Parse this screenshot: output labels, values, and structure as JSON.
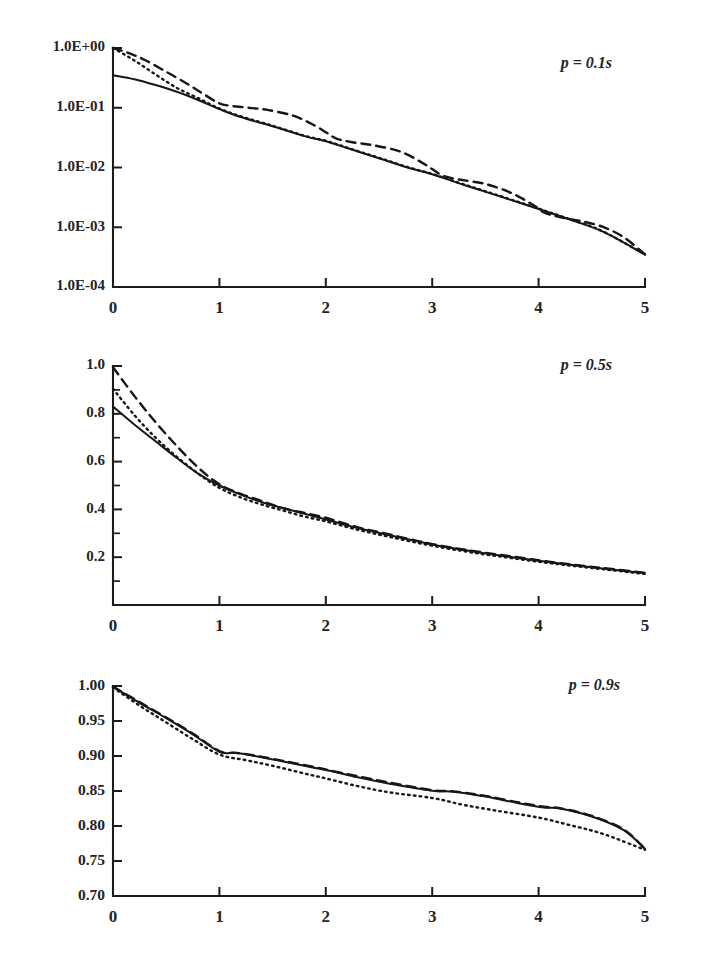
{
  "figure": {
    "background": "#ffffff",
    "ink_color": "#1a1a1a",
    "panel_count": 3
  },
  "chart_data": [
    {
      "type": "line",
      "title": "",
      "annotation": "p = 0.1s",
      "xlabel": "",
      "ylabel": "",
      "yscale": "log",
      "xlim": [
        0,
        5
      ],
      "ylim": [
        0.0001,
        1.0
      ],
      "xticks": [
        0,
        1,
        2,
        3,
        4,
        5
      ],
      "xtick_labels": [
        "0",
        "1",
        "2",
        "3",
        "4",
        "5"
      ],
      "yticks": [
        1.0,
        0.1,
        0.01,
        0.001,
        0.0001
      ],
      "ytick_labels": [
        "1.0E+00",
        "1.0E-01",
        "1.0E-02",
        "1.0E-03",
        "1.0E-04"
      ],
      "grid": false,
      "legend": "none",
      "series": [
        {
          "name": "dashed",
          "style": "dashed",
          "x": [
            0.0,
            0.15,
            0.3,
            0.5,
            0.7,
            0.85,
            1.0,
            1.1,
            1.25,
            1.45,
            1.7,
            1.9,
            2.0,
            2.1,
            2.25,
            2.45,
            2.7,
            2.9,
            3.0,
            3.1,
            3.25,
            3.5,
            3.75,
            3.95,
            4.05,
            4.2,
            4.4,
            4.6,
            4.8,
            5.0
          ],
          "y": [
            1.0,
            0.82,
            0.63,
            0.4,
            0.25,
            0.17,
            0.118,
            0.108,
            0.101,
            0.092,
            0.073,
            0.05,
            0.039,
            0.0305,
            0.0265,
            0.0235,
            0.0185,
            0.0122,
            0.0094,
            0.0073,
            0.0063,
            0.0053,
            0.0037,
            0.00235,
            0.00178,
            0.00148,
            0.00127,
            0.00102,
            0.00068,
            0.00035
          ]
        },
        {
          "name": "dotted",
          "style": "dotted",
          "x": [
            0.0,
            0.2,
            0.4,
            0.6,
            0.8,
            1.0,
            1.2,
            1.5,
            1.8,
            2.0,
            2.2,
            2.5,
            2.8,
            3.0,
            3.3,
            3.6,
            4.0,
            4.3,
            4.6,
            5.0
          ],
          "y": [
            1.0,
            0.62,
            0.36,
            0.215,
            0.145,
            0.097,
            0.072,
            0.05,
            0.034,
            0.028,
            0.0215,
            0.0145,
            0.0098,
            0.0078,
            0.0052,
            0.0035,
            0.00205,
            0.00135,
            0.00086,
            0.00035
          ]
        },
        {
          "name": "solid",
          "style": "solid",
          "x": [
            0.0,
            0.2,
            0.4,
            0.6,
            0.8,
            1.0,
            1.2,
            1.5,
            1.8,
            2.0,
            2.2,
            2.5,
            2.8,
            3.0,
            3.3,
            3.6,
            4.0,
            4.3,
            4.6,
            5.0
          ],
          "y": [
            0.35,
            0.3,
            0.24,
            0.185,
            0.135,
            0.095,
            0.07,
            0.049,
            0.0335,
            0.0275,
            0.0212,
            0.0143,
            0.0096,
            0.0077,
            0.0051,
            0.00345,
            0.00202,
            0.00133,
            0.00085,
            0.00035
          ]
        }
      ]
    },
    {
      "type": "line",
      "title": "",
      "annotation": "p = 0.5s",
      "xlabel": "",
      "ylabel": "",
      "yscale": "linear",
      "xlim": [
        0,
        5
      ],
      "ylim": [
        0.0,
        1.0
      ],
      "xticks": [
        0,
        1,
        2,
        3,
        4,
        5
      ],
      "xtick_labels": [
        "0",
        "1",
        "2",
        "3",
        "4",
        "5"
      ],
      "yticks": [
        0.2,
        0.4,
        0.6,
        0.8,
        1.0
      ],
      "ytick_labels": [
        "0.2",
        "0.4",
        "0.6",
        "0.8",
        "1.0"
      ],
      "yticks_minor": [
        0.1,
        0.3,
        0.5,
        0.7,
        0.9
      ],
      "grid": false,
      "legend": "none",
      "series": [
        {
          "name": "dashed",
          "style": "dashed",
          "x": [
            0.0,
            0.2,
            0.4,
            0.6,
            0.8,
            1.0,
            1.2,
            1.4,
            1.6,
            1.8,
            2.0,
            2.3,
            2.6,
            3.0,
            3.4,
            3.8,
            4.2,
            4.6,
            5.0
          ],
          "y": [
            0.995,
            0.875,
            0.765,
            0.665,
            0.575,
            0.505,
            0.465,
            0.435,
            0.405,
            0.385,
            0.365,
            0.325,
            0.295,
            0.255,
            0.225,
            0.2,
            0.175,
            0.155,
            0.135
          ]
        },
        {
          "name": "dotted",
          "style": "dotted",
          "x": [
            0.0,
            0.2,
            0.4,
            0.6,
            0.8,
            1.0,
            1.2,
            1.4,
            1.6,
            1.8,
            2.0,
            2.3,
            2.6,
            3.0,
            3.4,
            3.8,
            4.2,
            4.6,
            5.0
          ],
          "y": [
            0.905,
            0.795,
            0.7,
            0.62,
            0.55,
            0.49,
            0.45,
            0.42,
            0.395,
            0.37,
            0.35,
            0.315,
            0.285,
            0.248,
            0.218,
            0.193,
            0.17,
            0.15,
            0.13
          ]
        },
        {
          "name": "solid",
          "style": "solid",
          "x": [
            0.0,
            0.2,
            0.4,
            0.6,
            0.8,
            1.0,
            1.2,
            1.4,
            1.6,
            1.8,
            2.0,
            2.3,
            2.6,
            3.0,
            3.4,
            3.8,
            4.2,
            4.6,
            5.0
          ],
          "y": [
            0.83,
            0.755,
            0.685,
            0.615,
            0.55,
            0.5,
            0.462,
            0.43,
            0.405,
            0.382,
            0.358,
            0.322,
            0.292,
            0.253,
            0.223,
            0.197,
            0.174,
            0.153,
            0.133
          ]
        }
      ]
    },
    {
      "type": "line",
      "title": "",
      "annotation": "p = 0.9s",
      "xlabel": "",
      "ylabel": "",
      "yscale": "linear",
      "xlim": [
        0,
        5
      ],
      "ylim": [
        0.7,
        1.0
      ],
      "xticks": [
        0,
        1,
        2,
        3,
        4,
        5
      ],
      "xtick_labels": [
        "0",
        "1",
        "2",
        "3",
        "4",
        "5"
      ],
      "yticks": [
        0.7,
        0.75,
        0.8,
        0.85,
        0.9,
        0.95,
        1.0
      ],
      "ytick_labels": [
        "0.70",
        "0.75",
        "0.80",
        "0.85",
        "0.90",
        "0.95",
        "1.00"
      ],
      "grid": false,
      "legend": "none",
      "series": [
        {
          "name": "dashed",
          "style": "dashed",
          "x": [
            0.0,
            0.25,
            0.5,
            0.75,
            1.0,
            1.15,
            1.3,
            1.6,
            1.9,
            2.05,
            2.3,
            2.6,
            3.0,
            3.2,
            3.5,
            3.8,
            4.05,
            4.2,
            4.5,
            4.8,
            5.0
          ],
          "y": [
            0.999,
            0.977,
            0.955,
            0.932,
            0.907,
            0.9045,
            0.9015,
            0.893,
            0.884,
            0.879,
            0.871,
            0.862,
            0.851,
            0.8495,
            0.843,
            0.834,
            0.8275,
            0.8255,
            0.8145,
            0.795,
            0.7675
          ]
        },
        {
          "name": "solid",
          "style": "solid",
          "x": [
            0.0,
            0.25,
            0.5,
            0.75,
            1.0,
            1.15,
            1.3,
            1.6,
            1.9,
            2.05,
            2.3,
            2.6,
            3.0,
            3.2,
            3.5,
            3.8,
            4.05,
            4.2,
            4.5,
            4.8,
            5.0
          ],
          "y": [
            0.999,
            0.976,
            0.954,
            0.931,
            0.906,
            0.9045,
            0.901,
            0.892,
            0.883,
            0.8785,
            0.8695,
            0.8605,
            0.8505,
            0.849,
            0.842,
            0.833,
            0.8265,
            0.825,
            0.8135,
            0.794,
            0.767
          ]
        },
        {
          "name": "dotted",
          "style": "dotted",
          "x": [
            0.0,
            0.25,
            0.5,
            0.75,
            1.0,
            1.25,
            1.5,
            1.8,
            2.0,
            2.3,
            2.6,
            3.0,
            3.3,
            3.6,
            4.0,
            4.3,
            4.6,
            5.0
          ],
          "y": [
            0.998,
            0.972,
            0.948,
            0.924,
            0.902,
            0.894,
            0.886,
            0.875,
            0.868,
            0.857,
            0.848,
            0.84,
            0.83,
            0.822,
            0.812,
            0.801,
            0.789,
            0.766
          ]
        }
      ]
    }
  ]
}
